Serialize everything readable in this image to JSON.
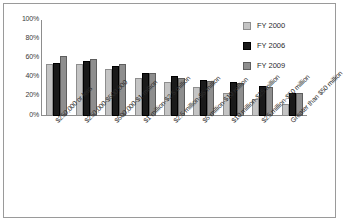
{
  "chart_data": {
    "type": "bar",
    "title": "",
    "subtitle": "",
    "xlabel": "",
    "ylabel": "",
    "ylim": [
      0,
      100
    ],
    "ytick_labels": [
      "100%",
      "80%",
      "60%",
      "40%",
      "20%",
      "0%"
    ],
    "ytick_values": [
      100,
      80,
      60,
      40,
      20,
      0
    ],
    "grid": false,
    "legend_position": "top-right",
    "categories": [
      "$250,000 or less",
      "$250,000-$500,000",
      "$500,000-$1 million",
      "$1 million-$2.5 million",
      "$2.5 million-$5 million",
      "$5 million-$10 million",
      "$10 million-$25 million",
      "$25 million-$50 million",
      "Greater than $50 million"
    ],
    "series": [
      {
        "name": "FY 2000",
        "color": "#c4c4c4",
        "values": [
          54,
          54,
          49,
          40,
          35,
          30,
          24,
          18,
          12
        ]
      },
      {
        "name": "FY 2006",
        "color": "#1a1a1a",
        "values": [
          55,
          57,
          52,
          45,
          42,
          38,
          35,
          31,
          24
        ]
      },
      {
        "name": "FY 2009",
        "color": "#8e8e8e",
        "values": [
          63,
          59,
          54,
          45,
          40,
          36,
          34,
          30,
          24
        ]
      }
    ]
  },
  "legend": {
    "items": [
      {
        "label": "FY 2000"
      },
      {
        "label": "FY 2006"
      },
      {
        "label": "FY 2009"
      }
    ]
  }
}
